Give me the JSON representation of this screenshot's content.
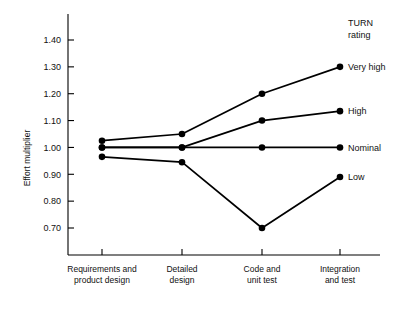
{
  "chart_data": {
    "type": "line",
    "title": "",
    "xlabel": "",
    "ylabel": "Effort multiplier",
    "ylim": [
      0.62,
      1.46
    ],
    "yticks": [
      "0.70",
      "0.80",
      "0.90",
      "1.00",
      "1.10",
      "1.20",
      "1.30",
      "1.40"
    ],
    "ytick_values": [
      0.7,
      0.8,
      0.9,
      1.0,
      1.1,
      1.2,
      1.3,
      1.4
    ],
    "grid": false,
    "legend_position": "right-inline",
    "legend_title_lines": [
      "TURN",
      "rating"
    ],
    "categories": [
      "Requirements and product design",
      "Detailed design",
      "Code and unit test",
      "Integration and test"
    ],
    "category_lines": [
      [
        "Requirements and",
        "product design"
      ],
      [
        "Detailed",
        "design"
      ],
      [
        "Code and",
        "unit test"
      ],
      [
        "Integration",
        "and test"
      ]
    ],
    "series": [
      {
        "name": "Very high",
        "values": [
          1.025,
          1.05,
          1.2,
          1.3
        ]
      },
      {
        "name": "High",
        "values": [
          1.0,
          1.0,
          1.1,
          1.135
        ]
      },
      {
        "name": "Nominal",
        "values": [
          1.0,
          1.0,
          1.0,
          1.0
        ]
      },
      {
        "name": "Low",
        "values": [
          0.965,
          0.945,
          0.7,
          0.89
        ]
      }
    ],
    "colors": {
      "line": "#000000",
      "marker": "#000000",
      "axis": "#000000",
      "background": "#ffffff"
    }
  }
}
